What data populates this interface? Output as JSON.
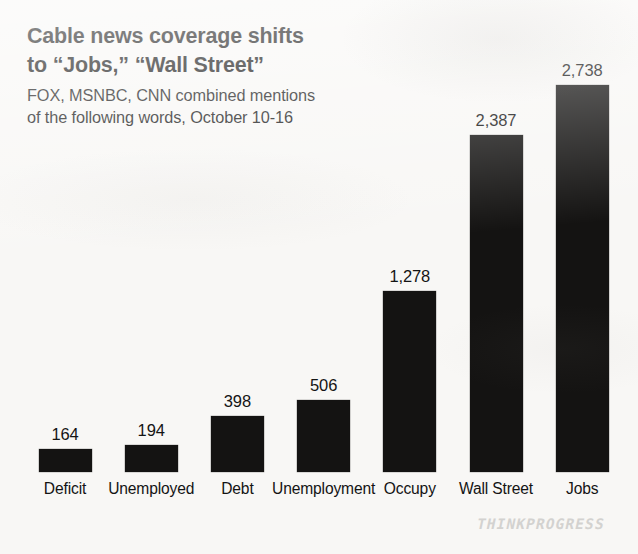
{
  "header": {
    "title_lines": [
      "Cable news coverage shifts",
      "to “Jobs,” “Wall Street”"
    ],
    "subtitle_lines": [
      "FOX, MSNBC, CNN combined mentions",
      "of the following words, October 10-16"
    ]
  },
  "watermark": {
    "text": "THINKPROGRESS"
  },
  "colors": {
    "bar": "#141312",
    "background": "#f8f7f5",
    "text": "#141414",
    "watermark": "#d3d2d0"
  },
  "chart_data": {
    "type": "bar",
    "title": "Cable news coverage shifts to “Jobs,” “Wall Street”",
    "subtitle": "FOX, MSNBC, CNN combined mentions of the following words, October 10-16",
    "xlabel": "",
    "ylabel": "",
    "ylim": [
      0,
      2738
    ],
    "grid": false,
    "legend": false,
    "axis_lines": false,
    "categories": [
      "Deficit",
      "Unemployed",
      "Debt",
      "Unemployment",
      "Occupy",
      "Wall Street",
      "Jobs"
    ],
    "values": [
      164,
      194,
      398,
      506,
      1278,
      2387,
      2738
    ],
    "value_labels": [
      "164",
      "194",
      "398",
      "506",
      "1,278",
      "2,387",
      "2,738"
    ]
  }
}
